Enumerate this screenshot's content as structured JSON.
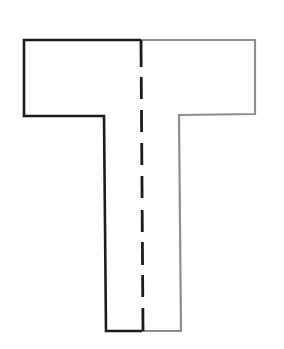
{
  "diagram": {
    "shape": "letter-T",
    "canvas": {
      "width": 284,
      "height": 349,
      "background": "#ffffff"
    },
    "colors": {
      "left_half": "#1c1c1c",
      "right_half": "#8e8e8e",
      "axis": "#1c1c1c"
    },
    "left_half": {
      "description": "Left half outline (dark)",
      "points": [
        [
          141,
          40
        ],
        [
          24,
          40
        ],
        [
          24,
          116
        ],
        [
          104,
          116
        ],
        [
          106,
          331
        ],
        [
          142,
          331
        ]
      ]
    },
    "right_half": {
      "description": "Right half outline (gray)",
      "points": [
        [
          141,
          40
        ],
        [
          255,
          40
        ],
        [
          255,
          114
        ],
        [
          179,
          115
        ],
        [
          181,
          331
        ],
        [
          142,
          331
        ]
      ]
    },
    "axis_of_symmetry": {
      "description": "Dashed vertical line of symmetry",
      "x_top": 141,
      "x_bottom": 143,
      "segments": [
        [
          40,
          67
        ],
        [
          77,
          99
        ],
        [
          110,
          132
        ],
        [
          143,
          165
        ],
        [
          176,
          198
        ],
        [
          210,
          232
        ],
        [
          242,
          265
        ],
        [
          275,
          297
        ],
        [
          308,
          331
        ]
      ]
    }
  }
}
